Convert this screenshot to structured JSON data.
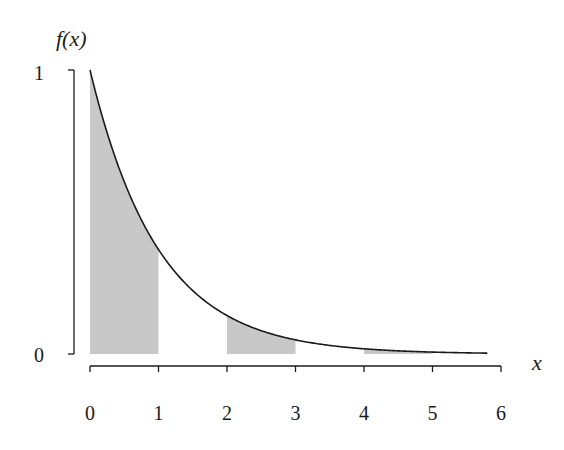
{
  "chart_data": {
    "type": "line",
    "title": "",
    "function": "f(x) = e^(-x)",
    "xlabel": "x",
    "ylabel": "f(x)",
    "xlim": [
      0,
      6
    ],
    "ylim": [
      0,
      1
    ],
    "x_ticks": [
      "0",
      "1",
      "2",
      "3",
      "4",
      "5",
      "6"
    ],
    "y_ticks": [
      "0",
      "1"
    ],
    "grid": false,
    "legend": null,
    "curve_domain": [
      0,
      5.8
    ],
    "series": [
      {
        "name": "f(x)",
        "x": [
          0,
          0.5,
          1,
          1.5,
          2,
          2.5,
          3,
          3.5,
          4,
          4.5,
          5,
          5.5,
          5.8
        ],
        "values": [
          1.0,
          0.607,
          0.368,
          0.223,
          0.135,
          0.082,
          0.05,
          0.03,
          0.018,
          0.011,
          0.007,
          0.004,
          0.003
        ]
      }
    ],
    "shaded_intervals": [
      [
        0,
        1
      ],
      [
        2,
        3
      ],
      [
        4,
        5
      ]
    ],
    "colors": {
      "curve": "#1a1a1a",
      "shade": "#c8c8c8",
      "axis": "#1a1a1a"
    }
  },
  "labels": {
    "y_axis": "f(x)",
    "x_axis": "x",
    "y_tick_top": "1",
    "y_tick_bottom": "0",
    "x_ticks": [
      "0",
      "1",
      "2",
      "3",
      "4",
      "5",
      "6"
    ]
  }
}
